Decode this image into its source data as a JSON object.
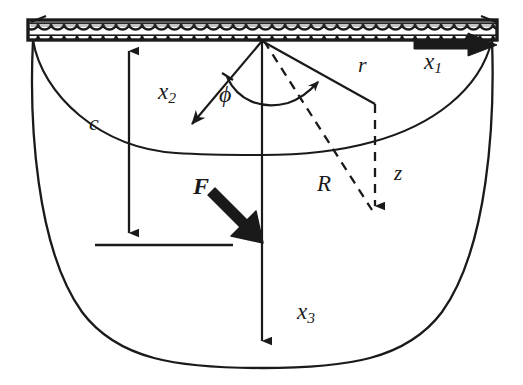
{
  "figure": {
    "background_color": "#ffffff",
    "line_color": "#1a1a1a"
  },
  "labels": {
    "x1": "x",
    "x1_sub": "1",
    "x2": "x",
    "x2_sub": "2",
    "x3": "x",
    "x3_sub": "3",
    "phi": "ϕ",
    "c": "c",
    "r": "r",
    "R": "R",
    "z": "z",
    "F": "F"
  },
  "elements": {
    "top_surface": {
      "name": "hatched-boundary-bar",
      "x_start": 28,
      "x_end": 497,
      "y_top": 20,
      "y_bottom": 40,
      "fill_pattern": "scalloped-hatch",
      "border_color": "#1a1a1a"
    },
    "outer_bowl": {
      "name": "outer-bowl-outline",
      "style": "solid",
      "left_rim_x": 33,
      "right_rim_x": 492,
      "bottom_y": 368
    },
    "inner_surface": {
      "name": "inner-ellipse-curve",
      "style": "solid",
      "left_x": 33,
      "right_x": 492,
      "center_dip_y": 153
    },
    "origin": {
      "x": 262,
      "y": 40
    },
    "axis_x1": {
      "name": "x1-axis-arrow",
      "direction": "right",
      "arrow_tip_x": 497,
      "arrow_y": 45
    },
    "axis_x2": {
      "name": "x2-axis-arrow",
      "direction": "down-left",
      "from": [
        262,
        40
      ],
      "to": [
        189,
        127
      ]
    },
    "axis_x3": {
      "name": "x3-axis-arrow",
      "direction": "down",
      "from": [
        262,
        40
      ],
      "to": [
        262,
        352
      ]
    },
    "angle_phi": {
      "name": "phi-angle-arc",
      "style": "solid-arc-with-arrowhead",
      "sweep_from_axis": "x2",
      "sweep_to_axis": "r"
    },
    "radial_r": {
      "name": "r-radial-line",
      "style": "solid",
      "from": [
        262,
        40
      ],
      "to": [
        374,
        103
      ]
    },
    "depth_z": {
      "name": "z-depth-arrow",
      "style": "dashed",
      "from": [
        374,
        103
      ],
      "to": [
        374,
        216
      ]
    },
    "spherical_R": {
      "name": "R-spherical-line",
      "style": "dashed",
      "from": [
        262,
        40
      ],
      "to": [
        374,
        216
      ]
    },
    "dim_c": {
      "name": "c-dimension-double-arrow",
      "style": "double-headed",
      "from": [
        129,
        41
      ],
      "to": [
        129,
        243
      ],
      "baseline_y": 245,
      "baseline_x_start": 95,
      "baseline_x_end": 233
    },
    "force_F": {
      "name": "force-vector-arrow",
      "style": "thick-solid",
      "from": [
        217,
        190
      ],
      "to": [
        262,
        240
      ]
    }
  }
}
